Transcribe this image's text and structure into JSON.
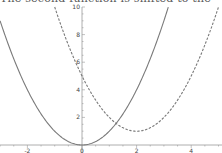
{
  "caption_fragment": "The second function is shifted to the",
  "chart_data": {
    "type": "line",
    "title": "",
    "xlabel": "",
    "ylabel": "",
    "xlim": [
      -3,
      5
    ],
    "ylim": [
      0,
      10
    ],
    "grid": false,
    "legend": null,
    "x_ticks": [
      -2,
      0,
      2,
      4
    ],
    "y_ticks": [
      2,
      4,
      6,
      8,
      10
    ],
    "series": [
      {
        "name": "y = x^2",
        "style": "solid",
        "color": "#7a7a7a",
        "x": [
          -3,
          -2.5,
          -2,
          -1.5,
          -1,
          -0.5,
          0,
          0.5,
          1,
          1.5,
          2,
          2.5,
          3,
          3.16
        ],
        "y": [
          9,
          6.25,
          4,
          2.25,
          1,
          0.25,
          0,
          0.25,
          1,
          2.25,
          4,
          6.25,
          9,
          10
        ]
      },
      {
        "name": "y = (x-2)^2 + 1",
        "style": "dashed",
        "color": "#7a7a7a",
        "x": [
          -1,
          -0.5,
          0,
          0.5,
          1,
          1.5,
          2,
          2.5,
          3,
          3.5,
          4,
          4.5,
          5
        ],
        "y": [
          10,
          7.25,
          5,
          3.25,
          2,
          1.25,
          1,
          1.25,
          2,
          3.25,
          5,
          7.25,
          10
        ]
      }
    ]
  },
  "axis": {
    "x_tick_labels": [
      "-2",
      "0",
      "2",
      "4"
    ],
    "y_tick_labels": [
      "2",
      "4",
      "6",
      "8",
      "10"
    ]
  }
}
